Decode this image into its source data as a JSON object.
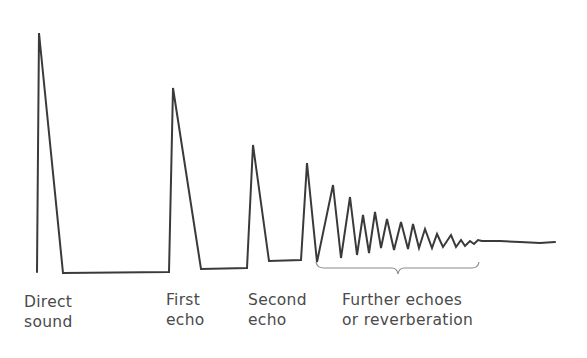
{
  "figure": {
    "colors": {
      "waveform": "#3a3a3a",
      "brace": "#8a8a8a",
      "text": "#4a4a4a",
      "background": "#ffffff"
    }
  },
  "labels": {
    "direct": {
      "line1": "Direct",
      "line2": "sound"
    },
    "first_echo": {
      "line1": "First",
      "line2": "echo"
    },
    "second_echo": {
      "line1": "Second",
      "line2": "echo"
    },
    "reverb": {
      "line1": "Further echoes",
      "line2": "or reverberation"
    }
  },
  "waveform": {
    "points": [
      [
        37,
        272
      ],
      [
        39,
        33
      ],
      [
        63,
        273
      ],
      [
        169,
        272
      ],
      [
        173,
        88
      ],
      [
        201,
        269
      ],
      [
        247,
        268
      ],
      [
        253,
        145
      ],
      [
        269,
        261
      ],
      [
        301,
        260
      ],
      [
        307,
        163
      ],
      [
        317,
        262
      ],
      [
        333,
        185
      ],
      [
        341,
        258
      ],
      [
        350,
        197
      ],
      [
        357,
        255
      ],
      [
        363,
        215
      ],
      [
        369,
        253
      ],
      [
        375,
        212
      ],
      [
        381,
        248
      ],
      [
        387,
        219
      ],
      [
        394,
        250
      ],
      [
        401,
        222
      ],
      [
        408,
        249
      ],
      [
        413,
        224
      ],
      [
        419,
        248
      ],
      [
        425,
        229
      ],
      [
        432,
        248
      ],
      [
        437,
        234
      ],
      [
        443,
        247
      ],
      [
        451,
        235
      ],
      [
        456,
        247
      ],
      [
        461,
        240
      ],
      [
        465,
        246
      ],
      [
        470,
        241
      ],
      [
        474,
        244
      ],
      [
        478,
        240
      ],
      [
        482,
        241
      ],
      [
        500,
        241
      ],
      [
        520,
        242
      ],
      [
        540,
        243
      ],
      [
        555,
        242
      ]
    ]
  }
}
